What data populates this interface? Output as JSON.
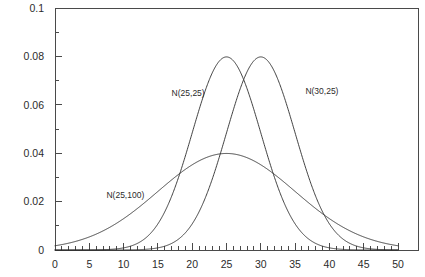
{
  "chart_data": {
    "type": "line",
    "title": "",
    "xlabel": "",
    "ylabel": "",
    "xlim": [
      0,
      50
    ],
    "ylim": [
      0,
      0.1
    ],
    "grid": false,
    "legend_position": "inline-annotations",
    "x_ticks_major": [
      0,
      5,
      10,
      15,
      20,
      25,
      30,
      35,
      40,
      45,
      50
    ],
    "x_tick_labels": [
      "0",
      "5",
      "10",
      "15",
      "20",
      "25",
      "30",
      "35",
      "40",
      "45",
      "50"
    ],
    "x_tick_minor_step": 1,
    "y_ticks_major": [
      0,
      0.02,
      0.04,
      0.06,
      0.08,
      0.1
    ],
    "y_tick_labels": [
      "0",
      "0.02",
      "0.04",
      "0.06",
      "0.08",
      "0.1"
    ],
    "y_tick_minor_step": 0.01,
    "series": [
      {
        "name": "N(25,25)",
        "distribution": "normal",
        "mean": 25,
        "variance": 25,
        "sigma": 5,
        "peak_value": 0.0798,
        "peak_x": 25,
        "label_x": 17,
        "label_y": 0.0635
      },
      {
        "name": "N(30,25)",
        "distribution": "normal",
        "mean": 30,
        "variance": 25,
        "sigma": 5,
        "peak_value": 0.0798,
        "peak_x": 30,
        "label_x": 36.5,
        "label_y": 0.0645
      },
      {
        "name": "N(25,100)",
        "distribution": "normal",
        "mean": 25,
        "variance": 100,
        "sigma": 10,
        "peak_value": 0.0399,
        "peak_x": 25,
        "label_x": 7.5,
        "label_y": 0.0215
      }
    ]
  },
  "labels": {
    "curve_1": "N(25,25)",
    "curve_2": "N(30,25)",
    "curve_3": "N(25,100)"
  },
  "colors": {
    "background": "#ffffff",
    "axis": "#4a4a4a",
    "curve": "#2b2b2b",
    "text": "#2b2b2b"
  }
}
